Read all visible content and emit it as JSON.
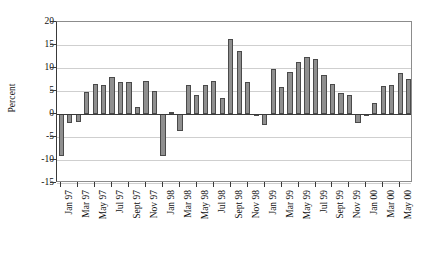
{
  "chart_data": {
    "type": "bar",
    "title": "",
    "xlabel": "",
    "ylabel": "Percent",
    "ylim": [
      -15,
      20
    ],
    "yticks": [
      -15,
      -10,
      -5,
      0,
      5,
      10,
      15,
      20
    ],
    "ytick_labels": [
      "-15",
      "-10",
      "-5",
      "0",
      "5",
      "10",
      "15",
      "20"
    ],
    "grid": true,
    "legend": "none",
    "bar_color": "#8f8f8f",
    "bar_edge_color": "#4a4a4a",
    "axis_color": "#3a3a3a",
    "gridline_color": "#cfcfcf",
    "categories": [
      "Jan 97",
      "Feb 97",
      "Mar 97",
      "Apr 97",
      "May 97",
      "Jun 97",
      "Jul 97",
      "Aug 97",
      "Sept 97",
      "Oct 97",
      "Nov 97",
      "Dec 97",
      "Jan 98",
      "Feb 98",
      "Mar 98",
      "Apr 98",
      "May 98",
      "Jun 98",
      "Jul 98",
      "Aug 98",
      "Sept 98",
      "Oct 98",
      "Nov 98",
      "Dec 98",
      "Jan 99",
      "Feb 99",
      "Mar 99",
      "Apr 99",
      "May 99",
      "Jun 99",
      "Jul 99",
      "Aug 99",
      "Sept 99",
      "Oct 99",
      "Nov 99",
      "Dec 99",
      "Jan 00",
      "Feb 00",
      "Mar 00",
      "Apr 00",
      "May 00",
      "Jun 00"
    ],
    "values": [
      -9.2,
      -2.0,
      -1.8,
      4.8,
      6.6,
      6.2,
      8.1,
      7.0,
      6.9,
      1.6,
      7.1,
      5.1,
      -9.2,
      0.5,
      -3.7,
      6.4,
      4.2,
      6.3,
      7.2,
      3.5,
      16.2,
      13.8,
      7.0,
      -0.4,
      -2.3,
      9.8,
      5.8,
      9.2,
      11.3,
      12.5,
      11.9,
      8.5,
      6.6,
      4.6,
      4.1,
      -1.9,
      -0.3,
      2.4,
      6.0,
      6.4,
      8.9,
      7.6
    ],
    "xtick_labels": [
      "Jan 97",
      "Mar 97",
      "May 97",
      "Jul 97",
      "Sept 97",
      "Nov 97",
      "Jan 98",
      "Mar 98",
      "May 98",
      "Jul 98",
      "Sept 98",
      "Nov 98",
      "Jan 99",
      "Mar 99",
      "May 99",
      "Jul 99",
      "Sept 99",
      "Nov 99",
      "Jan 00",
      "Mar 00",
      "May 00"
    ],
    "xtick_indices": [
      0,
      2,
      4,
      6,
      8,
      10,
      12,
      14,
      16,
      18,
      20,
      22,
      24,
      26,
      28,
      30,
      32,
      34,
      36,
      38,
      40
    ]
  }
}
